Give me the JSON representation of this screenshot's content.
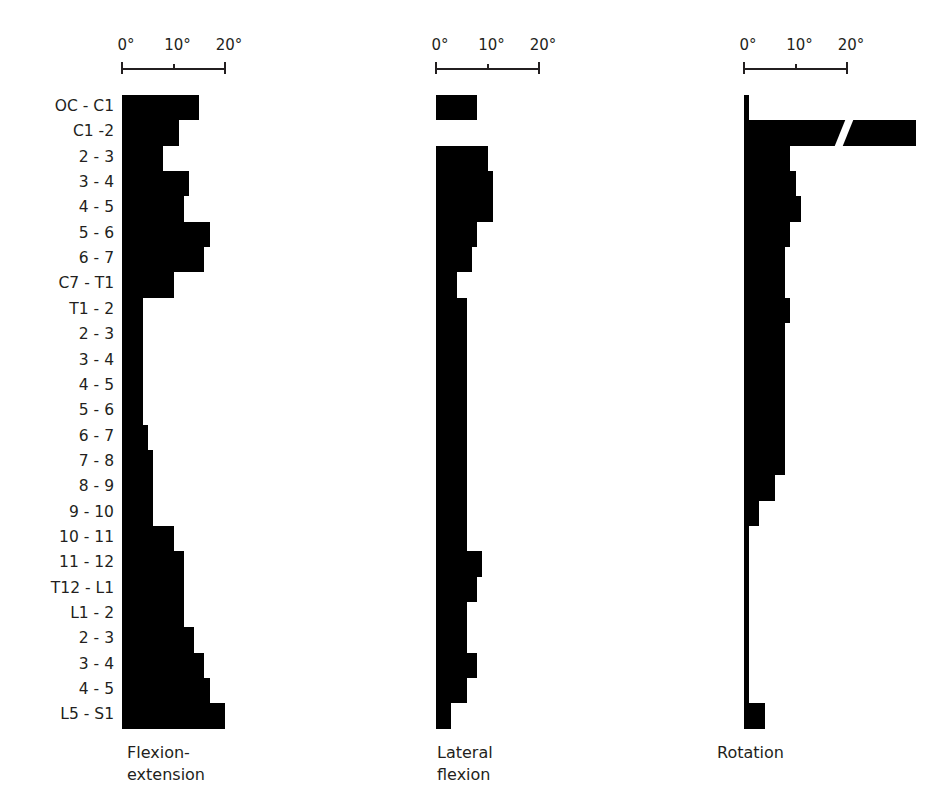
{
  "chart_data": {
    "type": "bar",
    "orientation": "horizontal",
    "categories": [
      "OC - C1",
      "C1 -2",
      "2 - 3",
      "3 - 4",
      "4 - 5",
      "5 - 6",
      "6 - 7",
      "C7 - T1",
      "T1 - 2",
      "2 - 3",
      "3 - 4",
      "4 - 5",
      "5 - 6",
      "6 - 7",
      "7 - 8",
      "8 - 9",
      "9 - 10",
      "10 - 11",
      "11 - 12",
      "T12 - L1",
      "L1 - 2",
      "2 - 3",
      "3 - 4",
      "4 - 5",
      "L5 - S1"
    ],
    "series": [
      {
        "name": "Flexion-extension",
        "values": [
          15,
          11,
          8,
          13,
          12,
          17,
          16,
          10,
          4,
          4,
          4,
          4,
          4,
          5,
          6,
          6,
          6,
          10,
          12,
          12,
          12,
          14,
          16,
          17,
          20
        ]
      },
      {
        "name": "Lateral flexion",
        "values": [
          8,
          0,
          10,
          11,
          11,
          8,
          7,
          4,
          6,
          6,
          6,
          6,
          6,
          6,
          6,
          6,
          6,
          6,
          9,
          8,
          6,
          6,
          8,
          6,
          3
        ]
      },
      {
        "name": "Rotation",
        "values": [
          1,
          47,
          9,
          10,
          11,
          9,
          8,
          8,
          9,
          8,
          8,
          8,
          8,
          8,
          8,
          6,
          3,
          1,
          1,
          1,
          1,
          1,
          1,
          1,
          4
        ]
      }
    ],
    "axis_ticks": [
      "0°",
      "10°",
      "20°"
    ],
    "xlim": [
      0,
      20
    ],
    "axis_break": {
      "series": "Rotation",
      "category": "C1 -2"
    },
    "grid": false,
    "legend": "titles below each panel",
    "units": "degrees"
  },
  "panels": [
    {
      "title": "Flexion-\nextension",
      "ticks": [
        "0°",
        "10°",
        "20°"
      ]
    },
    {
      "title": "Lateral\nflexion",
      "ticks": [
        "0°",
        "10°",
        "20°"
      ]
    },
    {
      "title": "Rotation",
      "ticks": [
        "0°",
        "10°",
        "20°"
      ]
    }
  ]
}
